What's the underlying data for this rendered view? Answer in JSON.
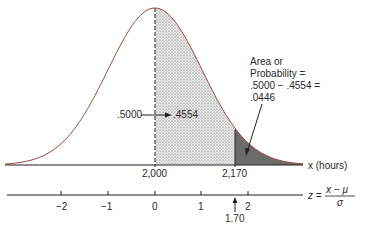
{
  "figure": {
    "type": "normal-distribution-diagram",
    "curve_color": "#9a4a4a",
    "shade_light": "#e2e2e2",
    "shade_dark": "#6b6b6b",
    "x_axis": {
      "label": "x (hours)",
      "ticks": [
        {
          "value": "2,000",
          "x": 155
        },
        {
          "value": "2,170",
          "x": 235
        }
      ]
    },
    "z_axis": {
      "label_z": "z =",
      "numerator": "x − μ",
      "denominator": "σ",
      "ticks": [
        {
          "value": "−2",
          "x": 61
        },
        {
          "value": "−1",
          "x": 108
        },
        {
          "value": "0",
          "x": 155
        },
        {
          "value": "1",
          "x": 201
        },
        {
          "value": "2",
          "x": 248
        }
      ],
      "marker": {
        "value": "1.70",
        "x": 235
      }
    },
    "annotations": {
      "half_area": ".5000",
      "middle_area": ".4554",
      "tail_lines": [
        "Area or",
        "Probability =",
        ".5000 − .4554 =",
        ".0446"
      ]
    }
  }
}
